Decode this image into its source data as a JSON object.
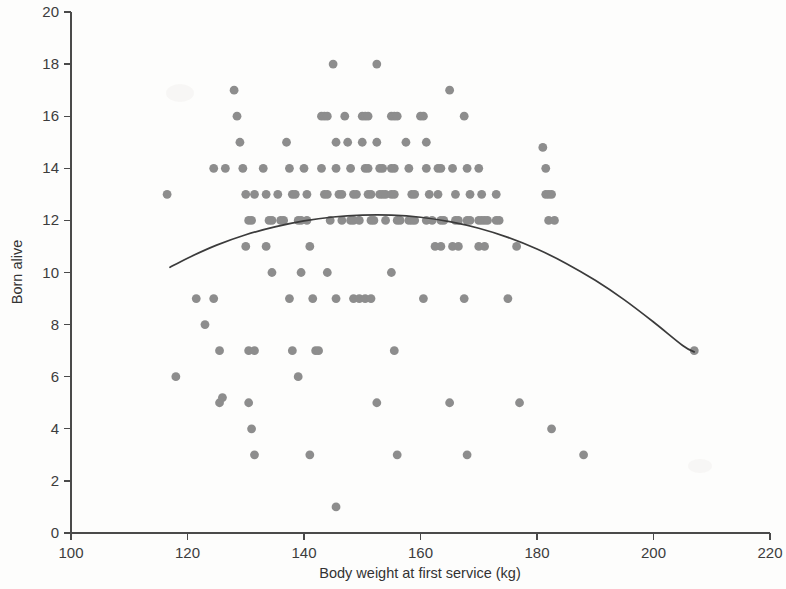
{
  "chart_data": {
    "type": "scatter",
    "title": "",
    "xlabel": "Body weight at first service (kg)",
    "ylabel": "Born alive",
    "xlim": [
      100,
      220
    ],
    "ylim": [
      0,
      20
    ],
    "xticks": [
      100,
      120,
      140,
      160,
      180,
      200,
      220
    ],
    "yticks": [
      0,
      2,
      4,
      6,
      8,
      10,
      12,
      14,
      16,
      18,
      20
    ],
    "grid": false,
    "legend": null,
    "marker_color": "#8d8d8d",
    "curve_color": "#3b3b3b",
    "axis_color": "#4a4a4a",
    "series": [
      {
        "name": "Sows",
        "marker": "circle",
        "points": [
          [
            118,
            6
          ],
          [
            116.5,
            13
          ],
          [
            121.5,
            9
          ],
          [
            123,
            8
          ],
          [
            124.5,
            14
          ],
          [
            126.5,
            14
          ],
          [
            124.5,
            9
          ],
          [
            125.5,
            7
          ],
          [
            125.5,
            5
          ],
          [
            126,
            5.2
          ],
          [
            128,
            17
          ],
          [
            128.5,
            16
          ],
          [
            129,
            15
          ],
          [
            129.5,
            14
          ],
          [
            130,
            13
          ],
          [
            130.5,
            12
          ],
          [
            131,
            12
          ],
          [
            131.5,
            13
          ],
          [
            130,
            11
          ],
          [
            130.5,
            7
          ],
          [
            131.5,
            7
          ],
          [
            130.5,
            5
          ],
          [
            131,
            4
          ],
          [
            131.5,
            3
          ],
          [
            133,
            14
          ],
          [
            133.5,
            13
          ],
          [
            134,
            12
          ],
          [
            134.5,
            12
          ],
          [
            133.5,
            11
          ],
          [
            134.5,
            10
          ],
          [
            135.5,
            13
          ],
          [
            136,
            12
          ],
          [
            136.5,
            12
          ],
          [
            137,
            15
          ],
          [
            137.5,
            14
          ],
          [
            138,
            13
          ],
          [
            138.5,
            13
          ],
          [
            139,
            12
          ],
          [
            139.5,
            12
          ],
          [
            137.5,
            9
          ],
          [
            138,
            7
          ],
          [
            139,
            6
          ],
          [
            139.5,
            10
          ],
          [
            140,
            14
          ],
          [
            140.5,
            13
          ],
          [
            140.5,
            12
          ],
          [
            141,
            11
          ],
          [
            141.5,
            9
          ],
          [
            142,
            7
          ],
          [
            142.5,
            7
          ],
          [
            141,
            3
          ],
          [
            143,
            16
          ],
          [
            143.5,
            16
          ],
          [
            144,
            16
          ],
          [
            143,
            14
          ],
          [
            143.5,
            13
          ],
          [
            144,
            13
          ],
          [
            144.5,
            12
          ],
          [
            144,
            10
          ],
          [
            145,
            18
          ],
          [
            145.5,
            15
          ],
          [
            145.5,
            14
          ],
          [
            146,
            13
          ],
          [
            146.5,
            13
          ],
          [
            146.5,
            12
          ],
          [
            145.5,
            9
          ],
          [
            145.5,
            1
          ],
          [
            147,
            16
          ],
          [
            147.5,
            15
          ],
          [
            148,
            14
          ],
          [
            148.5,
            13
          ],
          [
            148,
            12
          ],
          [
            148.5,
            12
          ],
          [
            149,
            13
          ],
          [
            149.5,
            12
          ],
          [
            148.5,
            9
          ],
          [
            149.5,
            9
          ],
          [
            150,
            16
          ],
          [
            150.5,
            16
          ],
          [
            151,
            16
          ],
          [
            150,
            15
          ],
          [
            150.5,
            14
          ],
          [
            151,
            14
          ],
          [
            151.5,
            13
          ],
          [
            151,
            13
          ],
          [
            151.5,
            12
          ],
          [
            152,
            12
          ],
          [
            150.5,
            9
          ],
          [
            151.5,
            9
          ],
          [
            152.5,
            18
          ],
          [
            152.5,
            15
          ],
          [
            153,
            14
          ],
          [
            153.5,
            14
          ],
          [
            153,
            13
          ],
          [
            153.5,
            13
          ],
          [
            154,
            13
          ],
          [
            154,
            12
          ],
          [
            152.5,
            5
          ],
          [
            155,
            16
          ],
          [
            155.5,
            16
          ],
          [
            156,
            16
          ],
          [
            155,
            14
          ],
          [
            155.5,
            14
          ],
          [
            155,
            13
          ],
          [
            155.5,
            13
          ],
          [
            156,
            12
          ],
          [
            156.5,
            12
          ],
          [
            155,
            10
          ],
          [
            155.5,
            7
          ],
          [
            156,
            3
          ],
          [
            157.5,
            15
          ],
          [
            158,
            14
          ],
          [
            158.5,
            13
          ],
          [
            158,
            12
          ],
          [
            158.5,
            12
          ],
          [
            159,
            12
          ],
          [
            159,
            13
          ],
          [
            160,
            16
          ],
          [
            160.5,
            16
          ],
          [
            161,
            15
          ],
          [
            161,
            14
          ],
          [
            161.5,
            13
          ],
          [
            161,
            12
          ],
          [
            162,
            12
          ],
          [
            160.5,
            9
          ],
          [
            163,
            14
          ],
          [
            163.5,
            14
          ],
          [
            163,
            13
          ],
          [
            163.5,
            12
          ],
          [
            164,
            12
          ],
          [
            162.5,
            11
          ],
          [
            163.5,
            11
          ],
          [
            165,
            17
          ],
          [
            165.5,
            14
          ],
          [
            166,
            13
          ],
          [
            166,
            12
          ],
          [
            166.5,
            12
          ],
          [
            165.5,
            11
          ],
          [
            166.5,
            11
          ],
          [
            165,
            5
          ],
          [
            167.5,
            16
          ],
          [
            168,
            14
          ],
          [
            168.5,
            13
          ],
          [
            168,
            12
          ],
          [
            168.5,
            12
          ],
          [
            167.5,
            9
          ],
          [
            168,
            3
          ],
          [
            170,
            14
          ],
          [
            170.5,
            13
          ],
          [
            170,
            12
          ],
          [
            170.5,
            12
          ],
          [
            171,
            12
          ],
          [
            171.5,
            12
          ],
          [
            170,
            11
          ],
          [
            171,
            11
          ],
          [
            173,
            13
          ],
          [
            173.5,
            12
          ],
          [
            173,
            12
          ],
          [
            175,
            9
          ],
          [
            176.5,
            11
          ],
          [
            177,
            5
          ],
          [
            181,
            14.8
          ],
          [
            181.5,
            13
          ],
          [
            181.5,
            14
          ],
          [
            182,
            13
          ],
          [
            182.5,
            13
          ],
          [
            182,
            12
          ],
          [
            183,
            12
          ],
          [
            182.5,
            4
          ],
          [
            188,
            3
          ],
          [
            207,
            7
          ]
        ]
      }
    ],
    "fit_curve": {
      "name": "Quadratic regression fit",
      "points": [
        [
          117,
          10.2
        ],
        [
          120,
          10.55
        ],
        [
          125,
          11.05
        ],
        [
          130,
          11.45
        ],
        [
          135,
          11.75
        ],
        [
          140,
          11.98
        ],
        [
          145,
          12.13
        ],
        [
          150,
          12.2
        ],
        [
          155,
          12.2
        ],
        [
          160,
          12.12
        ],
        [
          165,
          11.95
        ],
        [
          170,
          11.7
        ],
        [
          175,
          11.35
        ],
        [
          180,
          10.9
        ],
        [
          185,
          10.35
        ],
        [
          190,
          9.7
        ],
        [
          195,
          8.95
        ],
        [
          200,
          8.1
        ],
        [
          205,
          7.2
        ],
        [
          207,
          6.95
        ]
      ]
    }
  },
  "figure": {
    "y_axis_title": "Born alive",
    "x_axis_title": "Body weight at first service (kg)"
  }
}
